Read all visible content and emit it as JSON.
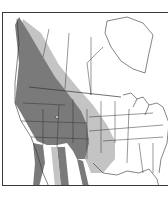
{
  "map": {
    "type": "species-range-map",
    "region": "North America",
    "colors": {
      "background": "#ffffff",
      "border": "#3a3a3a",
      "boundary_lines": "#333333",
      "primary_range": "#7a7a7a",
      "secondary_range": "#c4c4c4"
    },
    "legend": {
      "primary_label": "",
      "secondary_label": ""
    },
    "features": [
      {
        "name": "primary-range",
        "description": "Dark gray: Pacific coast through Great Basin and Rockies, extending south into Mexico"
      },
      {
        "name": "secondary-range",
        "description": "Light gray: eastern fringe through western Canada, Great Plains and Texas"
      },
      {
        "name": "great-lakes",
        "description": "Great Lakes outlines"
      },
      {
        "name": "hudson-bay",
        "description": "Hudson Bay outline"
      },
      {
        "name": "state-province-boundaries",
        "description": "US state and Canadian province lines"
      }
    ]
  }
}
